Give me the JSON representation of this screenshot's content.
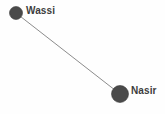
{
  "diagram": {
    "type": "node-link-graph",
    "background_color": "#fefefe",
    "node_color": "#4a4a4a",
    "node_stroke_color": "#3a3a3a",
    "edge_color": "#8c8c8c",
    "label_color": "#3d3d3d",
    "nodes": [
      {
        "id": "wassi",
        "label": "Wassi",
        "cx": 16,
        "cy": 13,
        "r": 6.5,
        "label_x": 26,
        "label_y": 6
      },
      {
        "id": "nasir",
        "label": "Nasir",
        "cx": 120,
        "cy": 94,
        "r": 8.5,
        "label_x": 131,
        "label_y": 86
      }
    ],
    "edges": [
      {
        "id": "wassi-nasir",
        "source": "wassi",
        "target": "nasir",
        "x1": 16,
        "y1": 13,
        "x2": 120,
        "y2": 94,
        "width": 1
      }
    ]
  }
}
